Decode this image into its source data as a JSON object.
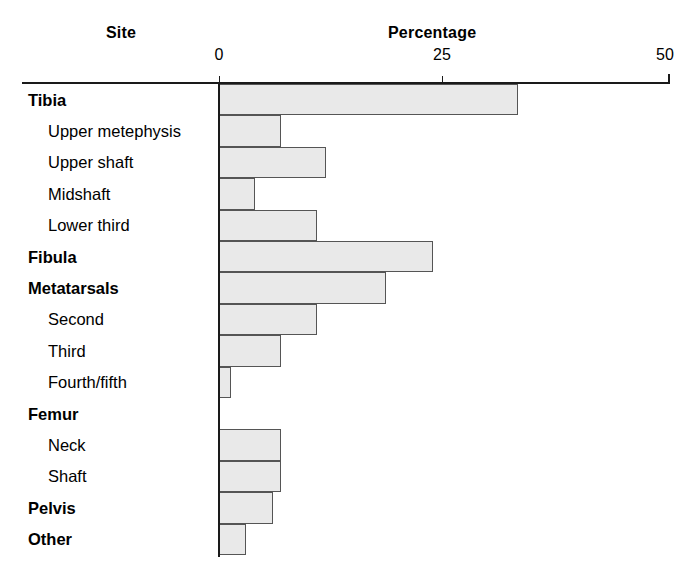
{
  "header": {
    "site_title": "Site",
    "percentage_title": "Percentage"
  },
  "axis": {
    "ticks": [
      {
        "label": "0",
        "value": 0
      },
      {
        "label": "25",
        "value": 25
      },
      {
        "label": "50",
        "value": 50
      }
    ],
    "min": 0,
    "max": 50
  },
  "style": {
    "bar_fill": "#e9e9e9",
    "bar_border": "#555555",
    "axis_color": "#1a1a1a",
    "text_color": "#000000",
    "background": "#ffffff"
  },
  "chart_data": {
    "type": "bar",
    "orientation": "horizontal",
    "title": "",
    "subtitle": "",
    "xlabel": "Percentage",
    "ylabel": "Site",
    "xlim": [
      0,
      50
    ],
    "grid": false,
    "legend": false,
    "xticks": [
      0,
      25,
      50
    ],
    "xticklabels": [
      "0",
      "25",
      "50"
    ],
    "categories": [
      "Tibia",
      "Upper metephysis",
      "Upper shaft",
      "Midshaft",
      "Lower third",
      "Fibula",
      "Metatarsals",
      "Second",
      "Third",
      "Fourth/fifth",
      "Femur",
      "Neck",
      "Shaft",
      "Pelvis",
      "Other"
    ],
    "values": [
      33.5,
      7,
      12,
      4,
      11,
      24,
      18.7,
      11,
      7,
      1.3,
      0,
      7,
      7,
      6,
      3
    ],
    "rows": [
      {
        "label": "Tibia",
        "level": "major",
        "value": 33.5
      },
      {
        "label": "Upper metephysis",
        "level": "sub",
        "value": 7
      },
      {
        "label": "Upper shaft",
        "level": "sub",
        "value": 12
      },
      {
        "label": "Midshaft",
        "level": "sub",
        "value": 4
      },
      {
        "label": "Lower third",
        "level": "sub",
        "value": 11
      },
      {
        "label": "Fibula",
        "level": "major",
        "value": 24
      },
      {
        "label": "Metatarsals",
        "level": "major",
        "value": 18.7
      },
      {
        "label": "Second",
        "level": "sub",
        "value": 11
      },
      {
        "label": "Third",
        "level": "sub",
        "value": 7
      },
      {
        "label": "Fourth/fifth",
        "level": "sub",
        "value": 1.3
      },
      {
        "label": "Femur",
        "level": "major",
        "value": 0
      },
      {
        "label": "Neck",
        "level": "sub",
        "value": 7
      },
      {
        "label": "Shaft",
        "level": "sub",
        "value": 7
      },
      {
        "label": "Pelvis",
        "level": "major",
        "value": 6
      },
      {
        "label": "Other",
        "level": "major",
        "value": 3
      }
    ]
  }
}
